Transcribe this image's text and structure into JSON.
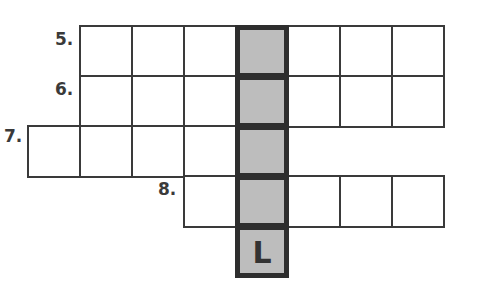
{
  "puzzle": {
    "type": "crossword",
    "highlight_color": "#bdbdbd",
    "border_color": "#3a3a3a",
    "rows": [
      {
        "clue_number": "5.",
        "label_pos": {
          "x": 55,
          "y": 31
        },
        "cells": [
          {
            "x": 79,
            "y": 25,
            "letter": "",
            "shaded": false
          },
          {
            "x": 131,
            "y": 25,
            "letter": "",
            "shaded": false
          },
          {
            "x": 183,
            "y": 25,
            "letter": "",
            "shaded": false
          },
          {
            "x": 235,
            "y": 25,
            "letter": "",
            "shaded": true
          },
          {
            "x": 287,
            "y": 25,
            "letter": "",
            "shaded": false
          },
          {
            "x": 339,
            "y": 25,
            "letter": "",
            "shaded": false
          },
          {
            "x": 391,
            "y": 25,
            "letter": "",
            "shaded": false
          }
        ]
      },
      {
        "clue_number": "6.",
        "label_pos": {
          "x": 55,
          "y": 81
        },
        "cells": [
          {
            "x": 79,
            "y": 75,
            "letter": "",
            "shaded": false
          },
          {
            "x": 131,
            "y": 75,
            "letter": "",
            "shaded": false
          },
          {
            "x": 183,
            "y": 75,
            "letter": "",
            "shaded": false
          },
          {
            "x": 235,
            "y": 75,
            "letter": "",
            "shaded": true
          },
          {
            "x": 287,
            "y": 75,
            "letter": "",
            "shaded": false
          },
          {
            "x": 339,
            "y": 75,
            "letter": "",
            "shaded": false
          },
          {
            "x": 391,
            "y": 75,
            "letter": "",
            "shaded": false
          }
        ]
      },
      {
        "clue_number": "7.",
        "label_pos": {
          "x": 4,
          "y": 128
        },
        "cells": [
          {
            "x": 27,
            "y": 125,
            "letter": "",
            "shaded": false
          },
          {
            "x": 79,
            "y": 125,
            "letter": "",
            "shaded": false
          },
          {
            "x": 131,
            "y": 125,
            "letter": "",
            "shaded": false
          },
          {
            "x": 183,
            "y": 125,
            "letter": "",
            "shaded": false
          },
          {
            "x": 235,
            "y": 125,
            "letter": "",
            "shaded": true
          }
        ]
      },
      {
        "clue_number": "8.",
        "label_pos": {
          "x": 158,
          "y": 181
        },
        "cells": [
          {
            "x": 183,
            "y": 175,
            "letter": "",
            "shaded": false
          },
          {
            "x": 235,
            "y": 175,
            "letter": "",
            "shaded": true
          },
          {
            "x": 287,
            "y": 175,
            "letter": "",
            "shaded": false
          },
          {
            "x": 339,
            "y": 175,
            "letter": "",
            "shaded": false
          },
          {
            "x": 391,
            "y": 175,
            "letter": "",
            "shaded": false
          }
        ]
      },
      {
        "clue_number": "",
        "label_pos": {
          "x": 0,
          "y": 0
        },
        "cells": [
          {
            "x": 235,
            "y": 225,
            "letter": "L",
            "shaded": true
          }
        ]
      }
    ]
  }
}
